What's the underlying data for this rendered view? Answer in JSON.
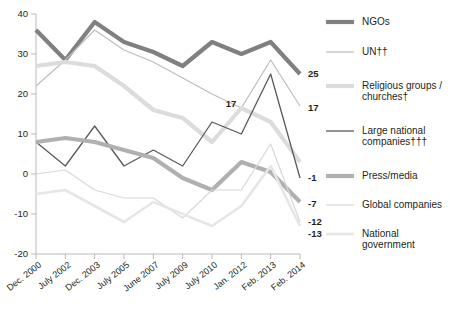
{
  "chart_data": {
    "type": "line",
    "title": "",
    "subtitle": "",
    "xlabel": "",
    "ylabel": "",
    "ylim": [
      -20,
      40
    ],
    "ytick_values": [
      40,
      30,
      20,
      10,
      0,
      -10,
      -20
    ],
    "ytick_labels": [
      "40",
      "30",
      "20",
      "10",
      "0",
      "-10",
      "-20"
    ],
    "grid": false,
    "legend_position": "right",
    "categories": [
      "Dec. 2000",
      "July 2002",
      "Dec. 2003",
      "July 2005",
      "June 2007",
      "July 2009",
      "July 2010",
      "Jan. 2012",
      "Feb. 2013",
      "Feb. 2014"
    ],
    "series": [
      {
        "name": "NGOs",
        "color": "#808080",
        "width": 4.2,
        "values": [
          36,
          28.5,
          38,
          33,
          30.5,
          27,
          33,
          30,
          33,
          25
        ],
        "end_label": "25"
      },
      {
        "name": "UN††",
        "color": "#bdbdbd",
        "width": 1.2,
        "values": [
          22,
          28.5,
          36,
          31,
          28,
          24,
          20,
          16.5,
          28.5,
          17
        ],
        "end_label": "17"
      },
      {
        "name": "Religious groups / churches†",
        "color": "#dcdcdc",
        "width": 4.2,
        "values": [
          27,
          28,
          27,
          22,
          16,
          14,
          8,
          16.5,
          13,
          3
        ],
        "end_label": ""
      },
      {
        "name": "Large national companies†††",
        "color": "#5a5a5a",
        "width": 1.3,
        "values": [
          8,
          2,
          12,
          2,
          6,
          2,
          13,
          10,
          25,
          -1
        ],
        "end_label": "-1"
      },
      {
        "name": "Press/media",
        "color": "#b0b0b0",
        "width": 4.2,
        "values": [
          8,
          9,
          8,
          6,
          4,
          -1,
          -4,
          3,
          0.5,
          -7
        ],
        "end_label": "-7"
      },
      {
        "name": "Global companies",
        "color": "#d8d8d8",
        "width": 1.2,
        "values": [
          0,
          1,
          -4,
          -6,
          -6,
          -11,
          -4,
          -4,
          7.5,
          -12
        ],
        "end_label": "-12"
      },
      {
        "name": "National government",
        "color": "#e6e6e6",
        "width": 2.6,
        "values": [
          -5,
          -4,
          -8,
          -12,
          -7,
          -10,
          -13,
          -8,
          2,
          -13
        ],
        "end_label": "-13"
      }
    ],
    "annotations": [
      {
        "text": "17",
        "series": "UN††",
        "x_index": 7,
        "y_value": 16.5
      }
    ]
  },
  "legend": {
    "items": [
      {
        "label": "NGOs"
      },
      {
        "label": "UN††"
      },
      {
        "label": "Religious groups /"
      },
      {
        "label": "churches†"
      },
      {
        "label": "Large national"
      },
      {
        "label": "companies†††"
      },
      {
        "label": "Press/media"
      },
      {
        "label": "Global companies"
      },
      {
        "label": "National"
      },
      {
        "label": "government"
      }
    ]
  }
}
